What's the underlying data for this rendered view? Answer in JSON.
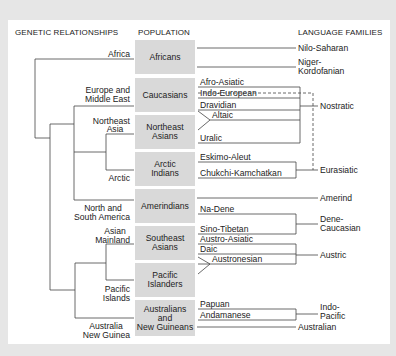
{
  "headers": {
    "genetic": "GENETIC RELATIONSHIPS",
    "population": "POPULATION",
    "language": "LANGUAGE FAMILIES"
  },
  "regions": {
    "africa": "Africa",
    "europe_1": "Europe and",
    "europe_2": "Middle East",
    "ne_asia_1": "Northeast",
    "ne_asia_2": "Asia",
    "arctic": "Arctic",
    "americas_1": "North and",
    "americas_2": "South America",
    "asian_mainland_1": "Asian",
    "asian_mainland_2": "Mainland",
    "pacific_islands_1": "Pacific",
    "pacific_islands_2": "Islands",
    "australia_1": "Australia",
    "australia_2": "New Guinea"
  },
  "populations": [
    {
      "line1": "Africans",
      "line2": "",
      "line3": ""
    },
    {
      "line1": "Caucasians",
      "line2": "",
      "line3": ""
    },
    {
      "line1": "Northeast",
      "line2": "Asians",
      "line3": ""
    },
    {
      "line1": "Arctic",
      "line2": "Indians",
      "line3": ""
    },
    {
      "line1": "Amerindians",
      "line2": "",
      "line3": ""
    },
    {
      "line1": "Southeast",
      "line2": "Asians",
      "line3": ""
    },
    {
      "line1": "Pacific",
      "line2": "Islanders",
      "line3": ""
    },
    {
      "line1": "Australians",
      "line2": "and",
      "line3": "New Guineans"
    }
  ],
  "languages": {
    "afro_asiatic": "Afro-Asiatic",
    "indo_european": "Indo-European",
    "dravidian": "Dravidian",
    "altaic": "Altaic",
    "uralic": "Uralic",
    "eskimo_aleut": "Eskimo-Aleut",
    "chukchi": "Chukchi-Kamchatkan",
    "na_dene": "Na-Dene",
    "sino_tibetan": "Sino-Tibetan",
    "austro_asiatic": "Austro-Asiatic",
    "daic": "Daic",
    "austronesian": "Austronesian",
    "papuan": "Papuan",
    "andamanese": "Andamanese"
  },
  "families": {
    "nilo_saharan": "Nilo-Saharan",
    "niger_1": "Niger-",
    "niger_2": "Kordofanian",
    "nostratic": "Nostratic",
    "eurasiatic": "Eurasiatic",
    "amerind": "Amerind",
    "dene_1": "Dene-",
    "dene_2": "Caucasian",
    "austric": "Austric",
    "indo_pacific_1": "Indo-",
    "indo_pacific_2": "Pacific",
    "australian": "Australian"
  },
  "colors": {
    "background": "#e6e6e6",
    "panel": "#ffffff",
    "box": "#d9d9d9",
    "line": "#444444"
  }
}
